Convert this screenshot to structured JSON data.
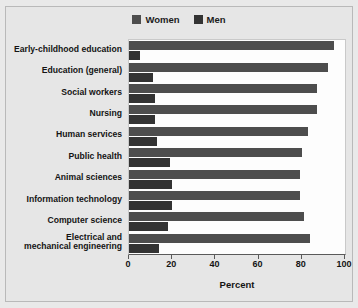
{
  "chart_data": {
    "type": "bar",
    "orientation": "horizontal",
    "title": "",
    "xlabel": "Percent",
    "ylabel": "",
    "xlim": [
      0,
      100
    ],
    "xticks": [
      0,
      20,
      40,
      60,
      80,
      100
    ],
    "grid": false,
    "legend_position": "top-center",
    "categories": [
      "Early-childhood education",
      "Education (general)",
      "Social workers",
      "Nursing",
      "Human services",
      "Public health",
      "Animal sciences",
      "Information technology",
      "Computer science",
      "Electrical and\nmechanical engineering"
    ],
    "series": [
      {
        "name": "Women",
        "color": "#4d4d4d",
        "values": [
          95,
          92,
          87,
          87,
          83,
          80,
          79,
          79,
          81,
          84
        ]
      },
      {
        "name": "Men",
        "color": "#333333",
        "values": [
          5,
          11,
          12,
          12,
          13,
          19,
          20,
          20,
          18,
          14
        ]
      }
    ]
  },
  "legend": {
    "entries": [
      {
        "label": "Women",
        "color": "#4d4d4d"
      },
      {
        "label": "Men",
        "color": "#333333"
      }
    ]
  },
  "axis": {
    "x_title": "Percent",
    "tick_labels": [
      "0",
      "20",
      "40",
      "60",
      "80",
      "100"
    ]
  },
  "categories_display": [
    {
      "line1": "Early-childhood education",
      "line2": ""
    },
    {
      "line1": "Education (general)",
      "line2": ""
    },
    {
      "line1": "Social workers",
      "line2": ""
    },
    {
      "line1": "Nursing",
      "line2": ""
    },
    {
      "line1": "Human services",
      "line2": ""
    },
    {
      "line1": "Public health",
      "line2": ""
    },
    {
      "line1": "Animal sciences",
      "line2": ""
    },
    {
      "line1": "Information technology",
      "line2": ""
    },
    {
      "line1": "Computer science",
      "line2": ""
    },
    {
      "line1": "Electrical and",
      "line2": "mechanical engineering"
    }
  ]
}
